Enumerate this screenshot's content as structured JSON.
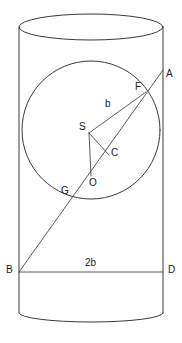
{
  "figure": {
    "type": "geometry-diagram",
    "canvas": {
      "width": 182,
      "height": 343
    },
    "colors": {
      "stroke": "#3a3a3a",
      "thin_stroke": "#4a4a4a",
      "label": "#1c1c1c",
      "background": "#ffffff"
    },
    "cylinder": {
      "left_x": 19,
      "right_x": 163,
      "top_center_y": 27,
      "ellipse_ry": 13,
      "body_bottom_y": 313,
      "bottom_arc_y": 320
    },
    "circle": {
      "center_x": 91,
      "center_y": 130,
      "radius": 69
    },
    "points": {
      "A": {
        "label": "A",
        "x": 163,
        "y": 70,
        "label_x": 166,
        "label_y": 69
      },
      "B": {
        "label": "B",
        "x": 19,
        "y": 272,
        "label_x": 6,
        "label_y": 265
      },
      "C": {
        "label": "C",
        "x": 109,
        "y": 155,
        "label_x": 111,
        "label_y": 148
      },
      "D": {
        "label": "D",
        "x": 163,
        "y": 272,
        "label_x": 168,
        "label_y": 265
      },
      "F": {
        "label": "F",
        "x": 146,
        "y": 92,
        "label_x": 135,
        "label_y": 82
      },
      "G": {
        "label": "G",
        "x": 74,
        "y": 200,
        "label_x": 61,
        "label_y": 186
      },
      "O": {
        "label": "O",
        "x": 91,
        "y": 176,
        "label_x": 89,
        "label_y": 178
      },
      "S": {
        "label": "S",
        "x": 89,
        "y": 133,
        "label_x": 79,
        "label_y": 122
      }
    },
    "measurements": {
      "radius_label": {
        "text": "b",
        "x": 105,
        "y": 99
      },
      "diameter_label": {
        "text": "2b",
        "x": 85,
        "y": 258
      }
    },
    "segments": [
      {
        "name": "line-A-B",
        "from": "A",
        "to": "B"
      },
      {
        "name": "line-B-D",
        "from": "B",
        "to": "D"
      },
      {
        "name": "segment-S-F",
        "from": "S",
        "to": "F"
      },
      {
        "name": "segment-S-C",
        "from": "S",
        "to": "C"
      },
      {
        "name": "segment-S-O",
        "from": "S",
        "to": "O"
      }
    ]
  }
}
